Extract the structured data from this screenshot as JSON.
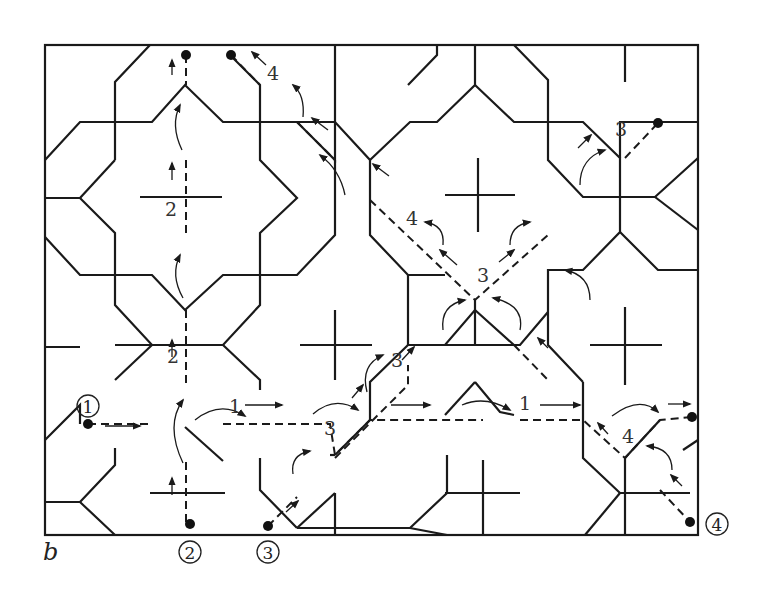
{
  "figure": {
    "panel_label": "b",
    "frame": {
      "x": 45,
      "y": 45,
      "w": 653,
      "h": 490
    },
    "colors": {
      "line": "#1a1a1a",
      "text": "#333333",
      "background": "#ffffff"
    }
  },
  "start_markers": [
    {
      "id": "1",
      "label": "1",
      "cx": 88,
      "cy": 406,
      "dot": [
        88,
        424
      ]
    },
    {
      "id": "2",
      "label": "2",
      "cx": 190,
      "cy": 552,
      "dot": [
        190,
        524
      ]
    },
    {
      "id": "3",
      "label": "3",
      "cx": 268,
      "cy": 552,
      "dot": [
        268,
        526
      ]
    },
    {
      "id": "4",
      "label": "4",
      "cx": 717,
      "cy": 524,
      "dot": [
        690,
        522
      ]
    }
  ],
  "end_dots": [
    [
      186,
      55
    ],
    [
      231,
      55
    ],
    [
      658,
      123
    ],
    [
      692,
      417
    ]
  ],
  "path_labels": [
    {
      "text": "2",
      "x": 165,
      "y": 216
    },
    {
      "text": "2",
      "x": 167,
      "y": 363
    },
    {
      "text": "4",
      "x": 267,
      "y": 80
    },
    {
      "text": "4",
      "x": 406,
      "y": 225
    },
    {
      "text": "3",
      "x": 477,
      "y": 282
    },
    {
      "text": "3",
      "x": 391,
      "y": 367
    },
    {
      "text": "3",
      "x": 324,
      "y": 435
    },
    {
      "text": "3",
      "x": 615,
      "y": 136
    },
    {
      "text": "1",
      "x": 229,
      "y": 413
    },
    {
      "text": "1",
      "x": 519,
      "y": 410
    },
    {
      "text": "4",
      "x": 622,
      "y": 443
    }
  ],
  "solid_lines": [
    "M45,160 L80,122 L152,122 L185,85 L223,122 L297,122 L335,160 L335,45",
    "M115,160 L115,82 L150,45",
    "M45,198 L80,198 L115,233 L115,305 L152,345 L223,345 L260,305 L260,233 L297,198 L260,160 L260,85 L230,55",
    "M80,198 L115,160",
    "M45,237 L80,275 L152,275 L185,310 L223,275 L297,275 L335,235 L335,160",
    "M115,345 L152,345",
    "M45,440 L80,405 L80,424",
    "M115,380 L152,345",
    "M223,345 L260,380 L260,390",
    "M45,502 L80,502 L115,535",
    "M80,502 L115,465 L115,448",
    "M185,427 L223,461",
    "M150,493 L225,493",
    "M260,458 L260,490 L297,528",
    "M297,528 L335,493",
    "M297,528 L410,528",
    "M335,493 L335,535",
    "M410,528 L447,493 L447,455",
    "M410,528 L447,535",
    "M297,122 L335,122 L370,160 L370,235 L408,275 L445,275",
    "M370,160 L410,122 L437,122 L475,85 L475,45",
    "M475,85 L514,122 L548,122 L548,160 L583,197 L620,197 L620,158 L583,122 L548,122",
    "M408,85 L437,55 L437,45",
    "M514,45 L548,80 L548,122",
    "M620,158 L620,122 L658,122 L698,122",
    "M620,197 L655,197 L698,158",
    "M655,197 L698,230",
    "M620,197 L620,232 L583,270 L548,270 L548,345 L583,382",
    "M620,232 L658,270 L698,270",
    "M408,275 L408,345 L445,345 L475,310 L514,345 L514,345",
    "M445,345 L475,345 L475,300",
    "M475,345 L520,345 L548,312",
    "M408,345 L370,382 L370,420",
    "M475,382 L500,412 L514,415",
    "M445,415 L475,382",
    "M330,455 L335,455",
    "M335,455 L370,420",
    "M583,382 L583,458 L620,493 L690,493",
    "M620,493 L585,535",
    "M625,458 L625,535",
    "M625,458 L660,420",
    "M683,450 L698,440",
    "M445,493 L520,493",
    "M483,460 L483,535",
    "M300,345 L372,345",
    "M335,310 L335,380",
    "M445,195 L515,195",
    "M478,158 L478,232",
    "M590,345 L662,345",
    "M625,307 L625,385",
    "M625,45 L625,82",
    "M140,197 L222,197",
    "M45,347 L80,347"
  ],
  "dashed_lines": [
    "M186,55 L186,85",
    "M186,160 L186,235",
    "M186,310 L186,388",
    "M186,462 L186,524",
    "M88,424 L152,424",
    "M223,424 L330,424 L335,455 L370,420 L445,420 L483,420",
    "M520,420 L583,420 L625,458 L660,420 L692,417",
    "M231,55 L260,85",
    "M297,122 L335,160",
    "M370,200 L475,300 L548,235",
    "M268,526 L297,497",
    "M335,458 L408,385 L408,365",
    "M514,345 L548,380",
    "M660,490 L690,522",
    "M625,158 L658,123"
  ],
  "arrows": [
    {
      "d": "M172,75 L172,60"
    },
    {
      "d": "M172,180 L172,163"
    },
    {
      "d": "M172,357 L172,340"
    },
    {
      "d": "M172,495 L172,478"
    },
    {
      "d": "M105,426 L140,426"
    },
    {
      "d": "M245,405 L282,405"
    },
    {
      "d": "M391,405 L430,405"
    },
    {
      "d": "M540,405 L580,405"
    },
    {
      "d": "M668,404 L690,404"
    },
    {
      "d": "M266,65 L252,52"
    },
    {
      "d": "M328,130 L312,118"
    },
    {
      "d": "M389,176 L373,164"
    },
    {
      "d": "M457,265 L440,250"
    },
    {
      "d": "M499,262 L514,250"
    },
    {
      "d": "M578,148 L591,135"
    },
    {
      "d": "M352,398 L363,385"
    },
    {
      "d": "M402,360 L414,347"
    },
    {
      "d": "M548,348 L538,338"
    },
    {
      "d": "M608,434 L598,423"
    },
    {
      "d": "M682,486 L671,475"
    },
    {
      "d": "M286,512 L298,501"
    }
  ],
  "curved_arrows": [
    "M182,150 Q170,125 180,105",
    "M183,298 Q170,275 180,255",
    "M183,463 Q165,425 183,400",
    "M195,420 Q220,400 245,416",
    "M313,414 Q335,395 358,410",
    "M367,392 Q360,365 383,355",
    "M345,195 Q340,170 320,155",
    "M303,117 Q305,95 293,85",
    "M443,245 Q445,225 425,222",
    "M510,245 Q510,225 530,222",
    "M443,330 Q440,305 465,300",
    "M520,330 Q525,305 493,298",
    "M462,405 Q485,395 510,410",
    "M580,185 Q580,158 605,150",
    "M590,300 Q590,275 565,270",
    "M612,416 Q640,395 658,412",
    "M672,470 Q672,448 647,446",
    "M293,474 Q290,455 310,451"
  ]
}
